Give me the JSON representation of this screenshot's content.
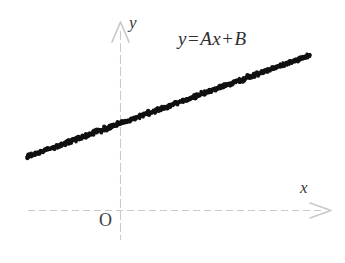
{
  "figure": {
    "width": 345,
    "height": 263,
    "background_color": "#ffffff"
  },
  "annotation": {
    "equation_full": "y = A x + B",
    "lhs": "y",
    "equals": "=",
    "coefficient": "A",
    "variable": "x",
    "plus": "+",
    "intercept": "B"
  },
  "axes": {
    "y_label": "y",
    "x_label": "x",
    "origin_label": "O",
    "axis_color": "#c9c9c9",
    "label_color": "#3a3a3a",
    "y_axis_x": 120,
    "y_axis_top": 25,
    "y_axis_bottom": 240,
    "x_axis_y": 210,
    "x_axis_left": 28,
    "x_axis_right": 330,
    "y_arrow": "arrow-up",
    "x_arrow": "arrow-right"
  },
  "chart_data": {
    "type": "scatter",
    "title": "",
    "subtitle": "",
    "xlabel": "x",
    "ylabel": "y",
    "origin_label": "O",
    "grid": false,
    "legend": "none",
    "annotations": [
      "y = A x + B"
    ],
    "series": [
      {
        "name": "y = A x + B",
        "color": "#111111",
        "marker": "dot",
        "description": "dense scatter of data points lying on a straight line of positive slope with positive y-intercept",
        "fit_line": {
          "slope_sign": "positive",
          "intercept_sign": "positive",
          "equation": "y = A x + B"
        },
        "x": [
          0.0,
          0.02,
          0.04,
          0.06,
          0.08,
          0.1,
          0.12,
          0.14,
          0.16,
          0.18,
          0.2,
          0.22,
          0.24,
          0.26,
          0.28,
          0.3,
          0.32,
          0.34,
          0.36,
          0.38,
          0.4,
          0.42,
          0.44,
          0.46,
          0.48,
          0.5,
          0.52,
          0.54,
          0.56,
          0.58,
          0.6,
          0.62,
          0.64,
          0.66,
          0.68,
          0.7,
          0.72,
          0.74,
          0.76,
          0.78,
          0.8,
          0.82,
          0.84,
          0.86,
          0.88,
          0.9,
          0.92,
          0.94,
          0.96,
          0.98,
          1.0
        ],
        "y": [
          0.186,
          0.2,
          0.213,
          0.227,
          0.241,
          0.255,
          0.269,
          0.283,
          0.296,
          0.31,
          0.324,
          0.338,
          0.352,
          0.365,
          0.379,
          0.393,
          0.407,
          0.421,
          0.434,
          0.448,
          0.462,
          0.476,
          0.49,
          0.503,
          0.517,
          0.531,
          0.545,
          0.559,
          0.572,
          0.586,
          0.6,
          0.614,
          0.628,
          0.641,
          0.655,
          0.669,
          0.683,
          0.697,
          0.71,
          0.724,
          0.738,
          0.752,
          0.766,
          0.779,
          0.793,
          0.807,
          0.821,
          0.835,
          0.848,
          0.862,
          0.876
        ]
      }
    ],
    "xlim": [
      0,
      1.07
    ],
    "ylim": [
      0,
      1.0
    ]
  }
}
